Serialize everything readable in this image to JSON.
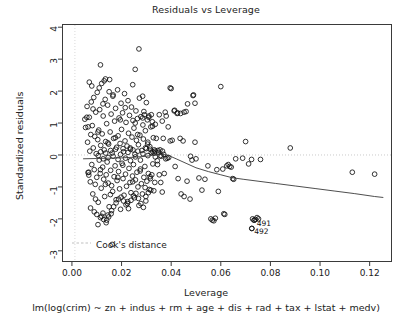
{
  "chart_data": {
    "type": "scatter",
    "title": "Residuals vs Leverage",
    "xlabel": "Leverage",
    "ylabel": "Standardized residuals",
    "subtitle": "lm(log(crim) ~ zn + indus + rm + age + dis + rad + tax + lstat + medv)",
    "xlim": [
      -0.004,
      0.129
    ],
    "ylim": [
      -3.35,
      4.1
    ],
    "xticks": [
      "0.00",
      "0.02",
      "0.04",
      "0.06",
      "0.08",
      "0.10",
      "0.12"
    ],
    "xtick_values": [
      0.0,
      0.02,
      0.04,
      0.06,
      0.08,
      0.1,
      0.12
    ],
    "yticks": [
      "4",
      "3",
      "2",
      "1",
      "0",
      "-1",
      "-2",
      "-3"
    ],
    "ytick_values": [
      4,
      3,
      2,
      1,
      0,
      -1,
      -2,
      -3
    ],
    "grid": false,
    "legend": {
      "position": "bottom-left",
      "entries": [
        "Cook's distance"
      ]
    },
    "reference_lines": [
      {
        "name": "zero-residual-line",
        "orientation": "horizontal",
        "value": 0,
        "style": "dotted",
        "color": "#bdbdbd"
      },
      {
        "name": "zero-leverage-line",
        "orientation": "vertical",
        "value": 0.0012,
        "style": "dotted",
        "color": "#cfcfcf"
      }
    ],
    "marker": {
      "shape": "open-circle",
      "radius": 2.35,
      "color": "#111111",
      "fill": "none"
    },
    "smoother": {
      "name": "loess-smoother",
      "color": "#3a3a3a",
      "points": [
        [
          0.0045,
          -0.12
        ],
        [
          0.01,
          -0.11
        ],
        [
          0.015,
          -0.1
        ],
        [
          0.02,
          -0.09
        ],
        [
          0.025,
          -0.07
        ],
        [
          0.03,
          -0.04
        ],
        [
          0.0335,
          0.0
        ],
        [
          0.036,
          0.02
        ],
        [
          0.0385,
          0.0
        ],
        [
          0.042,
          -0.12
        ],
        [
          0.046,
          -0.26
        ],
        [
          0.05,
          -0.4
        ],
        [
          0.055,
          -0.52
        ],
        [
          0.06,
          -0.62
        ],
        [
          0.0645,
          -0.71
        ],
        [
          0.069,
          -0.76
        ],
        [
          0.075,
          -0.82
        ],
        [
          0.082,
          -0.89
        ],
        [
          0.09,
          -0.97
        ],
        [
          0.098,
          -1.05
        ],
        [
          0.106,
          -1.13
        ],
        [
          0.114,
          -1.21
        ],
        [
          0.122,
          -1.3
        ],
        [
          0.1255,
          -1.33
        ]
      ]
    },
    "annotations": [
      {
        "label": "491",
        "x": 0.0735,
        "y": -2.04
      },
      {
        "label": "492",
        "x": 0.0725,
        "y": -2.3
      }
    ],
    "points": [
      [
        0.0052,
        1.12
      ],
      [
        0.0055,
        0.86
      ],
      [
        0.0061,
        1.52
      ],
      [
        0.0063,
        0.4
      ],
      [
        0.0065,
        -0.55
      ],
      [
        0.0068,
        -0.63
      ],
      [
        0.007,
        1.18
      ],
      [
        0.0072,
        0.12
      ],
      [
        0.0074,
        -0.84
      ],
      [
        0.0076,
        0.64
      ],
      [
        0.0078,
        1.66
      ],
      [
        0.008,
        -0.3
      ],
      [
        0.0082,
        0.92
      ],
      [
        0.0084,
        -1.22
      ],
      [
        0.0086,
        0.22
      ],
      [
        0.0088,
        1.8
      ],
      [
        0.009,
        -0.46
      ],
      [
        0.0092,
        0.58
      ],
      [
        0.0094,
        -0.92
      ],
      [
        0.0096,
        1.34
      ],
      [
        0.0098,
        0.04
      ],
      [
        0.01,
        -0.7
      ],
      [
        0.0102,
        1.96
      ],
      [
        0.0104,
        0.48
      ],
      [
        0.0106,
        -1.48
      ],
      [
        0.0108,
        0.78
      ],
      [
        0.011,
        -0.16
      ],
      [
        0.0112,
        1.42
      ],
      [
        0.0114,
        -0.58
      ],
      [
        0.0116,
        0.3
      ],
      [
        0.0118,
        -1.04
      ],
      [
        0.012,
        2.24
      ],
      [
        0.0122,
        0.66
      ],
      [
        0.0124,
        -0.38
      ],
      [
        0.0126,
        1.22
      ],
      [
        0.0128,
        -0.76
      ],
      [
        0.013,
        0.16
      ],
      [
        0.0132,
        -1.3
      ],
      [
        0.0134,
        1.74
      ],
      [
        0.0136,
        0.42
      ],
      [
        0.0138,
        -0.62
      ],
      [
        0.014,
        0.98
      ],
      [
        0.0142,
        -0.22
      ],
      [
        0.0144,
        1.56
      ],
      [
        0.0146,
        -0.88
      ],
      [
        0.0148,
        0.34
      ],
      [
        0.015,
        -1.62
      ],
      [
        0.0152,
        2.36
      ],
      [
        0.0154,
        0.72
      ],
      [
        0.0156,
        -0.48
      ],
      [
        0.0158,
        1.28
      ],
      [
        0.016,
        -0.96
      ],
      [
        0.0162,
        0.06
      ],
      [
        0.0164,
        -1.14
      ],
      [
        0.0166,
        1.88
      ],
      [
        0.0168,
        0.52
      ],
      [
        0.017,
        -0.68
      ],
      [
        0.0172,
        1.06
      ],
      [
        0.0174,
        -0.34
      ],
      [
        0.0176,
        1.46
      ],
      [
        0.0178,
        -1.4
      ],
      [
        0.018,
        0.24
      ],
      [
        0.0182,
        -0.8
      ],
      [
        0.0184,
        2.04
      ],
      [
        0.0186,
        0.6
      ],
      [
        0.0188,
        -0.52
      ],
      [
        0.019,
        1.16
      ],
      [
        0.0192,
        -1.06
      ],
      [
        0.0194,
        0.36
      ],
      [
        0.0196,
        -1.7
      ],
      [
        0.0198,
        1.62
      ],
      [
        0.02,
        0.8
      ],
      [
        0.0202,
        -0.26
      ],
      [
        0.0204,
        1.32
      ],
      [
        0.0206,
        -0.74
      ],
      [
        0.0208,
        0.1
      ],
      [
        0.021,
        -1.26
      ],
      [
        0.0212,
        1.92
      ],
      [
        0.0214,
        0.44
      ],
      [
        0.0216,
        -0.6
      ],
      [
        0.0218,
        1.02
      ],
      [
        0.022,
        -0.98
      ],
      [
        0.0222,
        0.28
      ],
      [
        0.0224,
        -1.52
      ],
      [
        0.0226,
        1.7
      ],
      [
        0.0228,
        0.68
      ],
      [
        0.023,
        -0.42
      ],
      [
        0.0232,
        1.24
      ],
      [
        0.0234,
        -0.86
      ],
      [
        0.0236,
        0.18
      ],
      [
        0.0238,
        -1.18
      ],
      [
        0.024,
        1.5
      ],
      [
        0.0242,
        0.56
      ],
      [
        0.0244,
        -0.66
      ],
      [
        0.0246,
        1.08
      ],
      [
        0.0248,
        -0.3
      ],
      [
        0.025,
        0.84
      ],
      [
        0.0252,
        -1.34
      ],
      [
        0.0254,
        0.02
      ],
      [
        0.0256,
        -0.78
      ],
      [
        0.0258,
        1.38
      ],
      [
        0.026,
        0.46
      ],
      [
        0.0262,
        -0.54
      ],
      [
        0.0264,
        1.14
      ],
      [
        0.0266,
        -1.0
      ],
      [
        0.0268,
        0.32
      ],
      [
        0.027,
        -1.58
      ],
      [
        0.0272,
        1.78
      ],
      [
        0.0274,
        0.62
      ],
      [
        0.0276,
        -0.44
      ],
      [
        0.0278,
        1.2
      ],
      [
        0.028,
        -0.9
      ],
      [
        0.0282,
        0.14
      ],
      [
        0.0284,
        -1.22
      ],
      [
        0.0286,
        0.94
      ],
      [
        0.0288,
        0.5
      ],
      [
        0.029,
        -0.7
      ],
      [
        0.0292,
        1.26
      ],
      [
        0.0294,
        -0.36
      ],
      [
        0.0296,
        0.76
      ],
      [
        0.0298,
        -1.44
      ],
      [
        0.03,
        0.2
      ],
      [
        0.0302,
        -0.82
      ],
      [
        0.0304,
        1.1
      ],
      [
        0.0306,
        0.4
      ],
      [
        0.0308,
        -0.58
      ],
      [
        0.031,
        1.18
      ],
      [
        0.0312,
        -1.08
      ],
      [
        0.0314,
        0.26
      ],
      [
        0.0316,
        -0.74
      ],
      [
        0.0318,
        0.88
      ],
      [
        0.032,
        0.08
      ],
      [
        0.0322,
        -0.62
      ],
      [
        0.0324,
        1.04
      ],
      [
        0.0326,
        -0.28
      ],
      [
        0.0328,
        0.54
      ],
      [
        0.033,
        -1.12
      ],
      [
        0.0332,
        0.16
      ],
      [
        0.0334,
        -0.86
      ],
      [
        0.0336,
        0.96
      ],
      [
        0.007,
        2.28
      ],
      [
        0.008,
        2.16
      ],
      [
        0.009,
        -1.78
      ],
      [
        0.01,
        -1.86
      ],
      [
        0.011,
        2.1
      ],
      [
        0.012,
        -1.92
      ],
      [
        0.013,
        2.32
      ],
      [
        0.014,
        -2.04
      ],
      [
        0.015,
        1.98
      ],
      [
        0.016,
        -1.74
      ],
      [
        0.0105,
        -2.18
      ],
      [
        0.0115,
        -1.96
      ],
      [
        0.0125,
        -1.82
      ],
      [
        0.0135,
        2.38
      ],
      [
        0.0145,
        -1.88
      ],
      [
        0.0115,
        2.82
      ],
      [
        0.0162,
        -2.8
      ],
      [
        0.0255,
        2.68
      ],
      [
        0.027,
        3.32
      ],
      [
        0.0245,
        2.2
      ],
      [
        0.0285,
        1.84
      ],
      [
        0.03,
        1.64
      ],
      [
        0.031,
        1.22
      ],
      [
        0.032,
        1.26
      ],
      [
        0.029,
        1.36
      ],
      [
        0.006,
        1.18
      ],
      [
        0.0065,
        0.88
      ],
      [
        0.0068,
        -0.54
      ],
      [
        0.0075,
        -1.66
      ],
      [
        0.0085,
        1.44
      ],
      [
        0.0095,
        -1.38
      ],
      [
        0.0105,
        0.72
      ],
      [
        0.0115,
        -0.46
      ],
      [
        0.0125,
        1.6
      ],
      [
        0.0135,
        -0.92
      ],
      [
        0.0145,
        0.38
      ],
      [
        0.0155,
        -1.24
      ],
      [
        0.0165,
        1.84
      ],
      [
        0.0175,
        0.54
      ],
      [
        0.0185,
        -0.7
      ],
      [
        0.0195,
        1.1
      ],
      [
        0.0205,
        -0.32
      ],
      [
        0.0215,
        1.48
      ],
      [
        0.0225,
        -1.46
      ],
      [
        0.0235,
        0.22
      ],
      [
        0.0245,
        -0.84
      ],
      [
        0.0255,
        1.0
      ],
      [
        0.0265,
        0.64
      ],
      [
        0.0275,
        -0.5
      ],
      [
        0.0285,
        1.16
      ],
      [
        0.0295,
        -1.02
      ],
      [
        0.0305,
        0.34
      ],
      [
        0.0315,
        -0.68
      ],
      [
        0.0325,
        0.9
      ],
      [
        0.0335,
        0.12
      ],
      [
        0.0128,
        -2.02
      ],
      [
        0.0138,
        -2.12
      ],
      [
        0.0148,
        -1.94
      ],
      [
        0.0158,
        -1.84
      ],
      [
        0.0168,
        -1.62
      ],
      [
        0.0178,
        -1.5
      ],
      [
        0.0188,
        -1.38
      ],
      [
        0.0198,
        -1.32
      ],
      [
        0.0208,
        -1.44
      ],
      [
        0.0218,
        -1.56
      ],
      [
        0.0228,
        -1.68
      ],
      [
        0.0238,
        -1.42
      ],
      [
        0.0248,
        -1.28
      ],
      [
        0.0258,
        -1.2
      ],
      [
        0.0268,
        -1.36
      ],
      [
        0.0278,
        -1.52
      ],
      [
        0.0288,
        -1.64
      ],
      [
        0.0298,
        -1.3
      ],
      [
        0.0308,
        -1.18
      ],
      [
        0.0318,
        -1.1
      ],
      [
        0.0106,
        -0.02
      ],
      [
        0.0116,
        0.1
      ],
      [
        0.0126,
        -0.12
      ],
      [
        0.0136,
        0.06
      ],
      [
        0.0146,
        -0.08
      ],
      [
        0.0156,
        0.14
      ],
      [
        0.0166,
        -0.04
      ],
      [
        0.0176,
        0.18
      ],
      [
        0.0186,
        -0.14
      ],
      [
        0.0196,
        0.02
      ],
      [
        0.0206,
        0.2
      ],
      [
        0.0216,
        -0.1
      ],
      [
        0.0226,
        0.08
      ],
      [
        0.0236,
        -0.18
      ],
      [
        0.0246,
        0.16
      ],
      [
        0.0256,
        -0.06
      ],
      [
        0.0266,
        0.12
      ],
      [
        0.0276,
        -0.16
      ],
      [
        0.0286,
        0.04
      ],
      [
        0.0296,
        0.22
      ],
      [
        0.0306,
        -0.02
      ],
      [
        0.0316,
        0.18
      ],
      [
        0.0326,
        0.1
      ],
      [
        0.0336,
        -0.06
      ],
      [
        0.0346,
        0.14
      ],
      [
        0.035,
        0.08
      ],
      [
        0.0355,
        0.16
      ],
      [
        0.036,
        -0.04
      ],
      [
        0.0365,
        0.12
      ],
      [
        0.037,
        0.02
      ],
      [
        0.034,
        0.52
      ],
      [
        0.0345,
        -0.3
      ],
      [
        0.0352,
        -0.62
      ],
      [
        0.0358,
        -0.86
      ],
      [
        0.0364,
        -1.16
      ],
      [
        0.0372,
        -0.58
      ],
      [
        0.0378,
        -0.12
      ],
      [
        0.0384,
        -0.1
      ],
      [
        0.039,
        -0.08
      ],
      [
        0.0396,
        0.44
      ],
      [
        0.0352,
        1.26
      ],
      [
        0.0364,
        1.06
      ],
      [
        0.0376,
        1.34
      ],
      [
        0.0388,
        0.88
      ],
      [
        0.04,
        2.08
      ],
      [
        0.0412,
        1.38
      ],
      [
        0.0424,
        1.3
      ],
      [
        0.0436,
        0.52
      ],
      [
        0.0448,
        0.44
      ],
      [
        0.046,
        1.36
      ],
      [
        0.0404,
        0.46
      ],
      [
        0.0416,
        -0.36
      ],
      [
        0.0428,
        -0.74
      ],
      [
        0.044,
        -1.22
      ],
      [
        0.0452,
        -1.3
      ],
      [
        0.0464,
        -0.82
      ],
      [
        0.0476,
        -1.38
      ],
      [
        0.0488,
        1.86
      ],
      [
        0.049,
        1.88
      ],
      [
        0.0496,
        0.4
      ],
      [
        0.0466,
        1.6
      ],
      [
        0.0478,
        -0.04
      ],
      [
        0.0484,
        -0.16
      ],
      [
        0.05,
        -0.12
      ],
      [
        0.0512,
        -0.72
      ],
      [
        0.0524,
        -1.1
      ],
      [
        0.0536,
        -0.76
      ],
      [
        0.0548,
        -0.34
      ],
      [
        0.056,
        -2.0
      ],
      [
        0.0566,
        -2.04
      ],
      [
        0.0572,
        -2.06
      ],
      [
        0.0578,
        -1.98
      ],
      [
        0.0584,
        -0.46
      ],
      [
        0.059,
        -1.14
      ],
      [
        0.06,
        2.14
      ],
      [
        0.0612,
        -1.84
      ],
      [
        0.0624,
        -0.34
      ],
      [
        0.0636,
        -0.36
      ],
      [
        0.0648,
        -0.74
      ],
      [
        0.0652,
        -0.76
      ],
      [
        0.0608,
        -0.44
      ],
      [
        0.0616,
        -1.86
      ],
      [
        0.063,
        -0.3
      ],
      [
        0.0642,
        -0.38
      ],
      [
        0.066,
        -0.12
      ],
      [
        0.07,
        0.42
      ],
      [
        0.0712,
        -0.28
      ],
      [
        0.0724,
        -0.14
      ],
      [
        0.0728,
        -2.0
      ],
      [
        0.0734,
        -2.04
      ],
      [
        0.074,
        -2.02
      ],
      [
        0.0746,
        -1.96
      ],
      [
        0.0752,
        -2.0
      ],
      [
        0.0725,
        -2.3
      ],
      [
        0.076,
        -0.14
      ],
      [
        0.0688,
        -0.1
      ],
      [
        0.088,
        0.22
      ],
      [
        0.113,
        -0.54
      ],
      [
        0.122,
        -0.6
      ],
      [
        0.0496,
        1.62
      ],
      [
        0.0452,
        1.34
      ],
      [
        0.0438,
        1.3
      ],
      [
        0.0426,
        1.32
      ],
      [
        0.0414,
        1.4
      ],
      [
        0.0396,
        2.1
      ],
      [
        0.038,
        1.22
      ],
      [
        0.0368,
        0.52
      ],
      [
        0.0356,
        -0.02
      ],
      [
        0.0344,
        -0.18
      ],
      [
        0.0332,
        0.06
      ]
    ]
  },
  "legend": {
    "cooks_distance_label": "Cook's distance"
  }
}
